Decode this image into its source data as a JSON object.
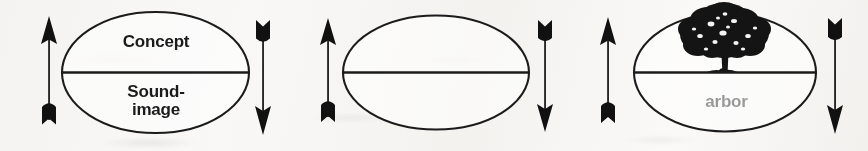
{
  "figure": {
    "background_color": "#f7f6f4",
    "ink_color": "#1b1b1b",
    "panel_count": 3
  },
  "panels": [
    {
      "id": "panel-abstract",
      "signified": "Concept",
      "signifier": "Sound-\nimage",
      "signified_kind": "text",
      "signifier_kind": "text",
      "left_arrow": "arrow-up",
      "right_arrow": "arrow-down"
    },
    {
      "id": "panel-tree-word",
      "signified": "“tree”",
      "signifier": "arbor",
      "signified_kind": "text",
      "signifier_kind": "text",
      "left_arrow": "arrow-up",
      "right_arrow": "arrow-down"
    },
    {
      "id": "panel-tree-image",
      "signified": "tree-illustration",
      "signifier": "arbor",
      "signified_kind": "image",
      "signifier_kind": "text",
      "left_arrow": "arrow-up",
      "right_arrow": "arrow-down"
    }
  ]
}
